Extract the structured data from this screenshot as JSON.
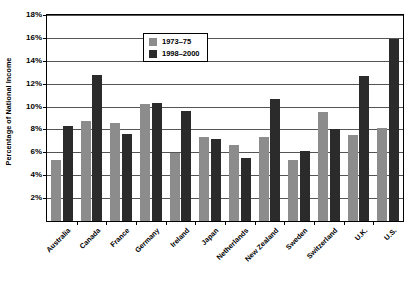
{
  "chart_data": {
    "type": "bar",
    "title": "",
    "xlabel": "",
    "ylabel": "Percentage of National Income",
    "ylim": [
      0,
      18
    ],
    "ytick_values": [
      2,
      4,
      6,
      8,
      10,
      12,
      14,
      16,
      18
    ],
    "ytick_labels": [
      "2%",
      "4%",
      "6%",
      "8%",
      "10%",
      "12%",
      "14%",
      "16%",
      "18%"
    ],
    "grid": true,
    "legend_position": "top-center",
    "categories": [
      "Australia",
      "Canada",
      "France",
      "Germany",
      "Ireland",
      "Japan",
      "Netherlands",
      "New Zealand",
      "Sweden",
      "Switzerland",
      "U.K.",
      "U.S."
    ],
    "series": [
      {
        "name": "1973–75",
        "color": "#8c8c8c",
        "values": [
          5.3,
          8.7,
          8.6,
          10.2,
          5.9,
          7.3,
          6.6,
          7.3,
          5.3,
          9.5,
          7.5,
          8.1
        ]
      },
      {
        "name": "1998–2000",
        "color": "#2b2b2b",
        "values": [
          8.3,
          12.8,
          7.6,
          10.3,
          9.6,
          7.2,
          5.5,
          10.7,
          6.1,
          8.0,
          12.7,
          15.9
        ]
      }
    ]
  }
}
